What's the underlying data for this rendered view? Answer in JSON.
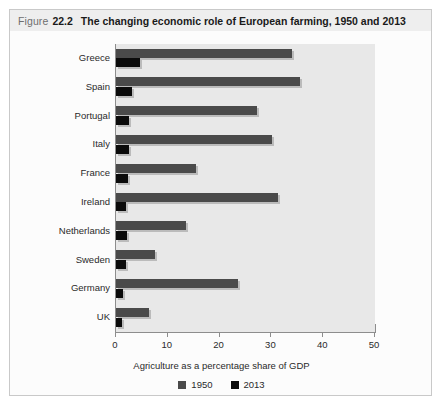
{
  "caption": {
    "figure_word": "Figure",
    "number": "22.2",
    "title": "The changing economic role of European farming, 1950 and 2013"
  },
  "chart_data": {
    "type": "bar",
    "orientation": "horizontal",
    "title": "The changing economic role of European farming, 1950 and 2013",
    "xlabel": "Agriculture as a percentage share of GDP",
    "ylabel": "",
    "xlim": [
      0,
      50
    ],
    "xticks": [
      0,
      10,
      20,
      30,
      40,
      50
    ],
    "xtick_labels": [
      "0",
      "10",
      "20",
      "30",
      "40",
      "50"
    ],
    "grid": false,
    "legend_position": "bottom",
    "categories": [
      "Greece",
      "Spain",
      "Portugal",
      "Italy",
      "France",
      "Ireland",
      "Netherlands",
      "Sweden",
      "Germany",
      "UK"
    ],
    "series": [
      {
        "name": "1950",
        "color": "#4a4a4a",
        "values": [
          34.0,
          35.5,
          27.3,
          30.2,
          15.5,
          31.3,
          13.5,
          7.5,
          23.5,
          6.4
        ]
      },
      {
        "name": "2013",
        "color": "#0b0b0b",
        "values": [
          4.6,
          3.0,
          2.6,
          2.6,
          2.3,
          2.0,
          2.1,
          1.9,
          1.3,
          1.1
        ]
      }
    ]
  }
}
